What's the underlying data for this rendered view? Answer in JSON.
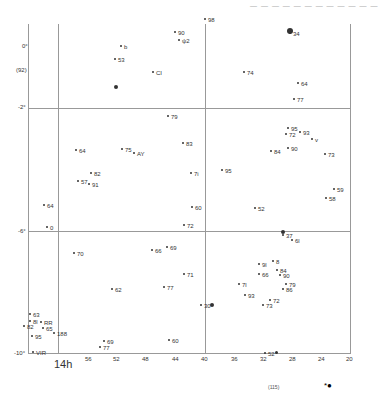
{
  "header": {
    "text": "— — —  — — —  — — — —  — —"
  },
  "chart_data": {
    "type": "scatter",
    "x_axis": {
      "label": "RA",
      "major": "14h",
      "ticks": [
        "56",
        "52",
        "48",
        "44",
        "40",
        "36",
        "32",
        "28",
        "24",
        "20"
      ]
    },
    "y_axis": {
      "ticks": [
        "0°",
        "-2°",
        "-6°",
        "-10°"
      ],
      "note": "(92)"
    },
    "labels": [
      {
        "t": "90",
        "x": 178,
        "y": 30
      },
      {
        "t": "ψ2",
        "x": 182,
        "y": 38
      },
      {
        "t": "98",
        "x": 208,
        "y": 17
      },
      {
        "t": "34",
        "x": 293,
        "y": 31
      },
      {
        "t": "b",
        "x": 124,
        "y": 44
      },
      {
        "t": "53",
        "x": 118,
        "y": 57
      },
      {
        "t": "CI",
        "x": 156,
        "y": 70
      },
      {
        "t": "74",
        "x": 247,
        "y": 70
      },
      {
        "t": "64",
        "x": 301,
        "y": 81
      },
      {
        "t": "77",
        "x": 297,
        "y": 97
      },
      {
        "t": "79",
        "x": 171,
        "y": 114
      },
      {
        "t": "95",
        "x": 291,
        "y": 126
      },
      {
        "t": "72",
        "x": 289,
        "y": 132
      },
      {
        "t": "93",
        "x": 303,
        "y": 130
      },
      {
        "t": "v",
        "x": 315,
        "y": 137
      },
      {
        "t": "83",
        "x": 186,
        "y": 141
      },
      {
        "t": "64",
        "x": 79,
        "y": 148
      },
      {
        "t": "75",
        "x": 125,
        "y": 147
      },
      {
        "t": "AY",
        "x": 137,
        "y": 151
      },
      {
        "t": "84",
        "x": 274,
        "y": 149
      },
      {
        "t": "90",
        "x": 291,
        "y": 146
      },
      {
        "t": "73",
        "x": 328,
        "y": 152
      },
      {
        "t": "82",
        "x": 94,
        "y": 171
      },
      {
        "t": "95",
        "x": 225,
        "y": 168
      },
      {
        "t": "57",
        "x": 81,
        "y": 179
      },
      {
        "t": "91",
        "x": 92,
        "y": 182
      },
      {
        "t": "7i",
        "x": 194,
        "y": 171
      },
      {
        "t": "59",
        "x": 337,
        "y": 187
      },
      {
        "t": "58",
        "x": 329,
        "y": 196
      },
      {
        "t": "64",
        "x": 47,
        "y": 203
      },
      {
        "t": "60",
        "x": 195,
        "y": 205
      },
      {
        "t": "52",
        "x": 258,
        "y": 206
      },
      {
        "t": "72",
        "x": 187,
        "y": 223
      },
      {
        "t": "0",
        "x": 50,
        "y": 225
      },
      {
        "t": "37",
        "x": 286,
        "y": 233
      },
      {
        "t": "6l",
        "x": 295,
        "y": 238
      },
      {
        "t": "69",
        "x": 170,
        "y": 245
      },
      {
        "t": "66",
        "x": 155,
        "y": 248
      },
      {
        "t": "70",
        "x": 77,
        "y": 251
      },
      {
        "t": "8",
        "x": 276,
        "y": 259
      },
      {
        "t": "9l",
        "x": 262,
        "y": 262
      },
      {
        "t": "84",
        "x": 280,
        "y": 268
      },
      {
        "t": "66",
        "x": 262,
        "y": 272
      },
      {
        "t": "90",
        "x": 283,
        "y": 273
      },
      {
        "t": "71",
        "x": 187,
        "y": 272
      },
      {
        "t": "79",
        "x": 289,
        "y": 282
      },
      {
        "t": "86",
        "x": 286,
        "y": 287
      },
      {
        "t": "7l",
        "x": 242,
        "y": 282
      },
      {
        "t": "62",
        "x": 115,
        "y": 287
      },
      {
        "t": "77",
        "x": 167,
        "y": 285
      },
      {
        "t": "93",
        "x": 248,
        "y": 293
      },
      {
        "t": "72",
        "x": 273,
        "y": 298
      },
      {
        "t": "73",
        "x": 266,
        "y": 303
      },
      {
        "t": "30",
        "x": 204,
        "y": 303
      },
      {
        "t": "63",
        "x": 33,
        "y": 312
      },
      {
        "t": "8l",
        "x": 33,
        "y": 319
      },
      {
        "t": "RR",
        "x": 44,
        "y": 320
      },
      {
        "t": "65",
        "x": 46,
        "y": 326
      },
      {
        "t": "82",
        "x": 27,
        "y": 324
      },
      {
        "t": "188",
        "x": 57,
        "y": 331
      },
      {
        "t": "95",
        "x": 35,
        "y": 334
      },
      {
        "t": "69",
        "x": 107,
        "y": 339
      },
      {
        "t": "77",
        "x": 103,
        "y": 345
      },
      {
        "t": "60",
        "x": 172,
        "y": 338
      },
      {
        "t": "VIR",
        "x": 36,
        "y": 350
      },
      {
        "t": "52",
        "x": 268,
        "y": 351
      }
    ]
  },
  "footer": {
    "page_label": "(115)",
    "symbol": "*●"
  }
}
